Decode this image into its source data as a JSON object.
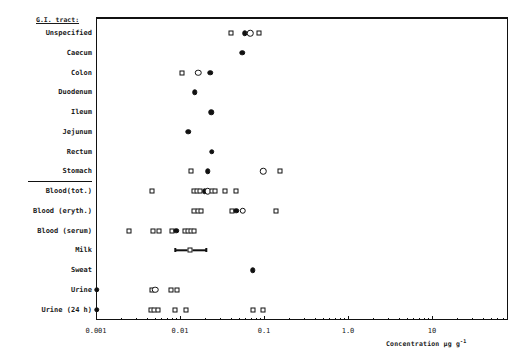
{
  "chart_data": {
    "type": "scatter",
    "title": "",
    "xlabel": "Concentration µg g⁻¹",
    "ylabel": "",
    "xscale": "log",
    "xlim": [
      0.001,
      30
    ],
    "xticks": [
      "0.001",
      "0.01",
      "0.1",
      "1.0",
      "10"
    ],
    "xtick_values": [
      0.001,
      0.01,
      0.1,
      1.0,
      10
    ],
    "grid": false,
    "legend": "none",
    "group_header": "G.I. tract:",
    "categories": [
      "Unspecified",
      "Caecum",
      "Colon",
      "Duodenum",
      "Ileum",
      "Jejunum",
      "Rectum",
      "Stomach",
      "Blood(tot.)",
      "Blood (eryth.)",
      "Blood (serum)",
      "Milk",
      "Sweat",
      "Urine",
      "Urine (24 h)"
    ],
    "marker_types": [
      "open-square",
      "filled-circle",
      "open-circle"
    ],
    "series": [
      {
        "name": "Unspecified",
        "points": [
          {
            "x": 0.04,
            "marker": "open-square"
          },
          {
            "x": 0.059,
            "marker": "filled-circle"
          },
          {
            "x": 0.069,
            "marker": "open-circle"
          },
          {
            "x": 0.088,
            "marker": "open-square"
          }
        ]
      },
      {
        "name": "Caecum",
        "points": [
          {
            "x": 0.055,
            "marker": "filled-circle"
          }
        ]
      },
      {
        "name": "Colon",
        "points": [
          {
            "x": 0.0105,
            "marker": "open-square"
          },
          {
            "x": 0.0165,
            "marker": "open-circle"
          },
          {
            "x": 0.023,
            "marker": "filled-circle"
          }
        ]
      },
      {
        "name": "Duodenum",
        "points": [
          {
            "x": 0.015,
            "marker": "filled-circle"
          }
        ]
      },
      {
        "name": "Ileum",
        "points": [
          {
            "x": 0.0235,
            "marker": "filled-circle"
          }
        ]
      },
      {
        "name": "Jejunum",
        "points": [
          {
            "x": 0.0125,
            "marker": "filled-circle"
          }
        ]
      },
      {
        "name": "Rectum",
        "points": [
          {
            "x": 0.024,
            "marker": "filled-circle"
          }
        ]
      },
      {
        "name": "Stomach",
        "points": [
          {
            "x": 0.0135,
            "marker": "open-square"
          },
          {
            "x": 0.0215,
            "marker": "filled-circle"
          },
          {
            "x": 0.098,
            "marker": "open-circle"
          },
          {
            "x": 0.155,
            "marker": "open-square"
          }
        ]
      },
      {
        "name": "Blood(tot.)",
        "points": [
          {
            "x": 0.0047,
            "marker": "open-square"
          },
          {
            "x": 0.0148,
            "marker": "open-square"
          },
          {
            "x": 0.016,
            "marker": "open-square"
          },
          {
            "x": 0.0173,
            "marker": "open-square"
          },
          {
            "x": 0.0198,
            "marker": "filled-circle"
          },
          {
            "x": 0.0215,
            "marker": "open-circle"
          },
          {
            "x": 0.0238,
            "marker": "open-square"
          },
          {
            "x": 0.0258,
            "marker": "open-square"
          },
          {
            "x": 0.034,
            "marker": "open-square"
          },
          {
            "x": 0.046,
            "marker": "open-square"
          }
        ]
      },
      {
        "name": "Blood (eryth.)",
        "points": [
          {
            "x": 0.0148,
            "marker": "open-square"
          },
          {
            "x": 0.0163,
            "marker": "open-square"
          },
          {
            "x": 0.018,
            "marker": "open-square"
          },
          {
            "x": 0.042,
            "marker": "open-square"
          },
          {
            "x": 0.047,
            "marker": "filled-circle"
          },
          {
            "x": 0.056,
            "marker": "open-circle"
          },
          {
            "x": 0.14,
            "marker": "open-square"
          }
        ]
      },
      {
        "name": "Blood (serum)",
        "points": [
          {
            "x": 0.0025,
            "marker": "open-square"
          },
          {
            "x": 0.0048,
            "marker": "open-square"
          },
          {
            "x": 0.0057,
            "marker": "open-square"
          },
          {
            "x": 0.0081,
            "marker": "open-square"
          },
          {
            "x": 0.009,
            "marker": "filled-circle"
          },
          {
            "x": 0.0115,
            "marker": "open-square"
          },
          {
            "x": 0.0125,
            "marker": "open-square"
          },
          {
            "x": 0.0135,
            "marker": "open-square"
          },
          {
            "x": 0.0146,
            "marker": "open-square"
          }
        ]
      },
      {
        "name": "Milk",
        "points": [
          {
            "x": 0.0133,
            "marker": "open-square",
            "xlow": 0.0088,
            "xhigh": 0.0205
          }
        ]
      },
      {
        "name": "Sweat",
        "points": [
          {
            "x": 0.073,
            "marker": "filled-circle"
          }
        ]
      },
      {
        "name": "Urine",
        "points": [
          {
            "x": 0.00102,
            "marker": "filled-circle"
          },
          {
            "x": 0.0046,
            "marker": "open-square"
          },
          {
            "x": 0.0051,
            "marker": "open-circle"
          },
          {
            "x": 0.0079,
            "marker": "open-square"
          },
          {
            "x": 0.0093,
            "marker": "open-square"
          }
        ]
      },
      {
        "name": "Urine (24 h)",
        "points": [
          {
            "x": 0.00102,
            "marker": "filled-circle"
          },
          {
            "x": 0.00455,
            "marker": "open-square"
          },
          {
            "x": 0.00495,
            "marker": "open-square"
          },
          {
            "x": 0.0054,
            "marker": "open-square"
          },
          {
            "x": 0.0087,
            "marker": "open-square"
          },
          {
            "x": 0.0118,
            "marker": "open-square"
          },
          {
            "x": 0.074,
            "marker": "open-square"
          },
          {
            "x": 0.098,
            "marker": "open-square"
          }
        ]
      }
    ]
  },
  "axis": {
    "xtitle_main": "Concentration µg g",
    "xtitle_sup": "-1"
  }
}
